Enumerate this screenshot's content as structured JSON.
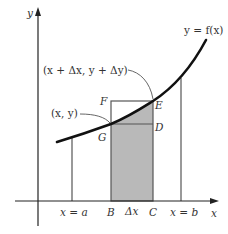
{
  "diagram": {
    "type": "area-under-curve",
    "colors": {
      "curve": "#111111",
      "axis": "#222222",
      "lines": "#555555",
      "shade": "#b9b9b9",
      "text": "#333333"
    },
    "labels": {
      "y_axis": "y",
      "x_axis": "x",
      "curve": "y = f(x)",
      "point_upper": "(x + Δx, y + Δy)",
      "point_lower": "(x, y)",
      "F": "F",
      "E": "E",
      "G": "G",
      "D": "D",
      "x_eq_a": "x = a",
      "B": "B",
      "delta_x": "Δx",
      "C": "C",
      "x_eq_b": "x = b"
    }
  }
}
